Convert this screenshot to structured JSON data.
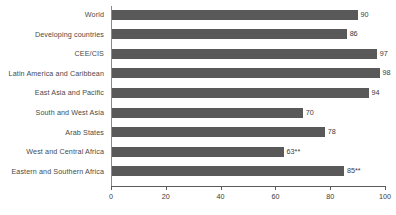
{
  "chart_data": {
    "type": "bar",
    "orientation": "horizontal",
    "title": "",
    "xlabel": "",
    "ylabel": "",
    "xlim": [
      0,
      100
    ],
    "xticks": [
      0,
      20,
      40,
      60,
      80,
      100
    ],
    "grid": false,
    "legend": null,
    "bar_color": "#595959",
    "categories": [
      "World",
      "Developing countries",
      "CEE/CIS",
      "Latin America and Caribbean",
      "East Asia and Pacific",
      "South and West Asia",
      "Arab States",
      "West and Central Africa",
      "Eastern and Southern Africa"
    ],
    "values": [
      90,
      86,
      97,
      98,
      94,
      70,
      78,
      63,
      85
    ],
    "data_labels": [
      "90",
      "86",
      "97",
      "98",
      "94",
      "70",
      "78",
      "63**",
      "85**"
    ]
  },
  "axis": {
    "tick_labels": [
      "0",
      "20",
      "40",
      "60",
      "80",
      "100"
    ]
  }
}
